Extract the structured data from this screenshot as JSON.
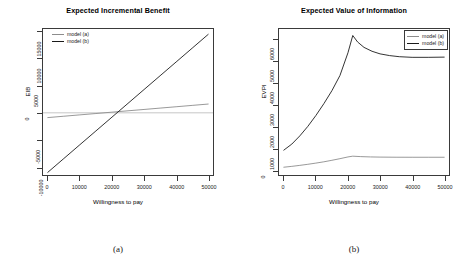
{
  "figure": {
    "captions": [
      "(a)",
      "(b)"
    ]
  },
  "chart_data": [
    {
      "type": "line",
      "title": "Expected Incremental Benefit",
      "xlabel": "Willingness to pay",
      "ylabel": "EIB",
      "xlim": [
        -1500,
        51500
      ],
      "ylim": [
        -11500,
        15500
      ],
      "xticks": [
        0,
        10000,
        20000,
        30000,
        40000,
        50000
      ],
      "xtick_labels": [
        "0",
        "10000",
        "20000",
        "30000",
        "40000",
        "50000"
      ],
      "yticks": [
        -10000,
        -5000,
        0,
        5000,
        10000,
        15000
      ],
      "ytick_labels": [
        "-10000",
        "-5000",
        "0",
        "5000",
        "10000",
        "15000"
      ],
      "grid": false,
      "legend_position": "top-left",
      "zero_line": true,
      "series": [
        {
          "name": "model (a)",
          "color": "#8c8c8c",
          "x": [
            0,
            5000,
            10000,
            15000,
            20000,
            25000,
            30000,
            35000,
            40000,
            45000,
            50000
          ],
          "values": [
            -880,
            -630,
            -380,
            -130,
            120,
            370,
            620,
            870,
            1120,
            1370,
            1620
          ]
        },
        {
          "name": "model (b)",
          "color": "#1a1a1a",
          "x": [
            0,
            5000,
            10000,
            15000,
            20000,
            25000,
            30000,
            35000,
            40000,
            45000,
            50000
          ],
          "values": [
            -11000,
            -8450,
            -5900,
            -3350,
            -800,
            1750,
            4300,
            6850,
            9400,
            11950,
            14500
          ]
        }
      ]
    },
    {
      "type": "line",
      "title": "Expected Value of Information",
      "xlabel": "Willingness to pay",
      "ylabel": "EVPI",
      "xlim": [
        -1500,
        51500
      ],
      "ylim": [
        -250,
        6500
      ],
      "xticks": [
        0,
        10000,
        20000,
        30000,
        40000,
        50000
      ],
      "xtick_labels": [
        "0",
        "10000",
        "20000",
        "30000",
        "40000",
        "50000"
      ],
      "yticks": [
        0,
        1000,
        2000,
        3000,
        4000,
        5000,
        6000
      ],
      "ytick_labels": [
        "0",
        "1000",
        "2000",
        "3000",
        "4000",
        "5000",
        "6000"
      ],
      "grid": false,
      "legend_position": "top-right",
      "zero_line": false,
      "series": [
        {
          "name": "model (a)",
          "color": "#8c8c8c",
          "x": [
            0,
            2500,
            5000,
            7500,
            10000,
            12500,
            15000,
            17500,
            20000,
            21500,
            24000,
            27000,
            30000,
            35000,
            40000,
            45000,
            50000
          ],
          "values": [
            110,
            150,
            195,
            245,
            300,
            360,
            430,
            505,
            585,
            620,
            600,
            585,
            578,
            572,
            570,
            570,
            570
          ]
        },
        {
          "name": "model (b)",
          "color": "#1a1a1a",
          "x": [
            0,
            2500,
            5000,
            7500,
            10000,
            12500,
            15000,
            17500,
            20000,
            21500,
            23000,
            25000,
            27500,
            30000,
            33000,
            36000,
            40000,
            45000,
            50000
          ],
          "values": [
            900,
            1180,
            1560,
            2000,
            2500,
            3050,
            3650,
            4350,
            5400,
            6200,
            5900,
            5650,
            5470,
            5350,
            5270,
            5220,
            5190,
            5190,
            5200
          ]
        }
      ]
    }
  ]
}
